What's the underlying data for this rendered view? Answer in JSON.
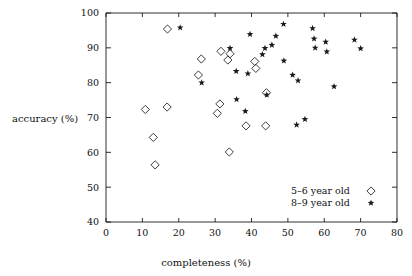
{
  "chart_data": {
    "type": "scatter",
    "title": "",
    "xlabel": "completeness (%)",
    "ylabel": "accuracy (%)",
    "xlim": [
      0,
      80
    ],
    "ylim": [
      40,
      100
    ],
    "xticks": [
      0,
      10,
      20,
      30,
      40,
      50,
      60,
      70,
      80
    ],
    "xtick_labels": [
      "0",
      "10",
      "20",
      "30",
      "40",
      "50",
      "60",
      "70",
      "80"
    ],
    "yticks": [
      40,
      50,
      60,
      70,
      80,
      90,
      100
    ],
    "ytick_labels": [
      "40",
      "50",
      "60",
      "70",
      "80",
      "90",
      "100"
    ],
    "grid": false,
    "legend_position": "lower right",
    "series": [
      {
        "name": "5-6 year old",
        "marker": "diamond",
        "color": "#1a1a1a",
        "points": [
          [
            10.8,
            72.3
          ],
          [
            13.0,
            64.3
          ],
          [
            13.5,
            56.4
          ],
          [
            16.8,
            73.0
          ],
          [
            16.9,
            95.4
          ],
          [
            25.4,
            82.2
          ],
          [
            26.2,
            86.8
          ],
          [
            30.6,
            71.2
          ],
          [
            31.3,
            73.9
          ],
          [
            31.6,
            89.0
          ],
          [
            33.5,
            86.5
          ],
          [
            33.9,
            60.1
          ],
          [
            34.1,
            88.3
          ],
          [
            38.5,
            67.6
          ],
          [
            40.9,
            86.1
          ],
          [
            41.2,
            84.1
          ],
          [
            43.9,
            67.6
          ],
          [
            44.1,
            77.1
          ]
        ]
      },
      {
        "name": "8-9 year old",
        "marker": "star",
        "color": "#1a1a1a",
        "points": [
          [
            20.4,
            95.8
          ],
          [
            26.3,
            80.0
          ],
          [
            34.1,
            89.9
          ],
          [
            35.8,
            83.3
          ],
          [
            35.9,
            75.2
          ],
          [
            38.3,
            71.8
          ],
          [
            39.0,
            82.6
          ],
          [
            39.6,
            93.9
          ],
          [
            43.0,
            88.1
          ],
          [
            43.7,
            89.9
          ],
          [
            44.2,
            76.5
          ],
          [
            45.6,
            90.8
          ],
          [
            46.7,
            93.4
          ],
          [
            48.8,
            96.8
          ],
          [
            48.9,
            86.3
          ],
          [
            51.3,
            82.2
          ],
          [
            52.4,
            67.9
          ],
          [
            52.8,
            80.6
          ],
          [
            54.7,
            69.5
          ],
          [
            56.8,
            95.6
          ],
          [
            57.2,
            92.6
          ],
          [
            57.5,
            90.0
          ],
          [
            60.4,
            91.7
          ],
          [
            60.7,
            88.9
          ],
          [
            62.7,
            78.9
          ],
          [
            68.3,
            92.3
          ],
          [
            70.0,
            89.8
          ]
        ]
      }
    ]
  },
  "legend": {
    "entries": [
      {
        "label": "5–6 year old",
        "marker": "diamond"
      },
      {
        "label": "8–9 year old",
        "marker": "star"
      }
    ]
  }
}
